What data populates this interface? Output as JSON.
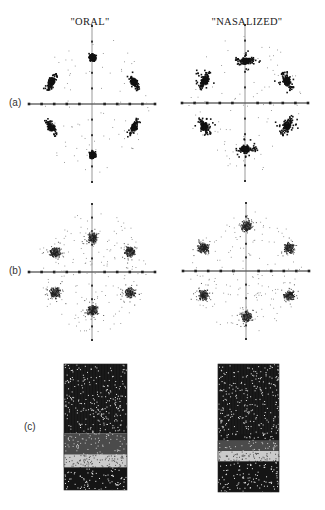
{
  "figure": {
    "columns": [
      {
        "title": "\"ORAL\"",
        "center_x": 90
      },
      {
        "title": "\"NASALIZED\"",
        "center_x": 247
      }
    ],
    "rows": [
      {
        "label": "(a)",
        "type": "polar-scatter"
      },
      {
        "label": "(b)",
        "type": "polar-scatter"
      },
      {
        "label": "(c)",
        "type": "spectrogram"
      }
    ],
    "caption_partial": "(cut off — illegible caption line at bottom edge)"
  },
  "chart_data": [
    {
      "type": "scatter",
      "panel": "(a)",
      "condition": "ORAL",
      "description": "Six-lobed star-shaped cluster pattern on crossed axes with tick marks",
      "axis_ticks_per_half": 5,
      "clusters": [
        {
          "angle_deg": 90,
          "radius": 0.75,
          "density": "dense",
          "shape": "compact"
        },
        {
          "angle_deg": 30,
          "radius": 0.72,
          "density": "dense",
          "shape": "chevron"
        },
        {
          "angle_deg": 150,
          "radius": 0.72,
          "density": "dense",
          "shape": "chevron"
        },
        {
          "angle_deg": 210,
          "radius": 0.72,
          "density": "dense",
          "shape": "chevron"
        },
        {
          "angle_deg": 330,
          "radius": 0.72,
          "density": "dense",
          "shape": "chevron"
        },
        {
          "angle_deg": 270,
          "radius": 0.8,
          "density": "dense",
          "shape": "compact"
        }
      ]
    },
    {
      "type": "scatter",
      "panel": "(a)",
      "condition": "NASALIZED",
      "description": "Six-lobed pattern with spikier, more spread clusters",
      "axis_ticks_per_half": 5,
      "clusters": [
        {
          "angle_deg": 90,
          "radius": 0.68,
          "density": "dense",
          "shape": "spiky"
        },
        {
          "angle_deg": 30,
          "radius": 0.72,
          "density": "dense",
          "shape": "spiky"
        },
        {
          "angle_deg": 150,
          "radius": 0.72,
          "density": "dense",
          "shape": "spiky"
        },
        {
          "angle_deg": 210,
          "radius": 0.72,
          "density": "dense",
          "shape": "spiky"
        },
        {
          "angle_deg": 330,
          "radius": 0.72,
          "density": "dense",
          "shape": "spiky"
        },
        {
          "angle_deg": 270,
          "radius": 0.72,
          "density": "dense",
          "shape": "spiky"
        }
      ]
    },
    {
      "type": "scatter",
      "panel": "(b)",
      "condition": "ORAL",
      "description": "Six-lobed pattern, more diffuse than (a)",
      "axis_ticks_per_half": 5,
      "clusters": [
        {
          "angle_deg": 90,
          "radius": 0.55,
          "density": "medium"
        },
        {
          "angle_deg": 30,
          "radius": 0.65,
          "density": "medium"
        },
        {
          "angle_deg": 150,
          "radius": 0.65,
          "density": "medium"
        },
        {
          "angle_deg": 210,
          "radius": 0.65,
          "density": "medium"
        },
        {
          "angle_deg": 330,
          "radius": 0.65,
          "density": "medium"
        },
        {
          "angle_deg": 270,
          "radius": 0.6,
          "density": "medium"
        }
      ]
    },
    {
      "type": "scatter",
      "panel": "(b)",
      "condition": "NASALIZED",
      "description": "Six triangular clusters with scattered outer points",
      "axis_ticks_per_half": 5,
      "clusters": [
        {
          "angle_deg": 90,
          "radius": 0.72,
          "density": "medium"
        },
        {
          "angle_deg": 30,
          "radius": 0.75,
          "density": "medium"
        },
        {
          "angle_deg": 150,
          "radius": 0.75,
          "density": "medium"
        },
        {
          "angle_deg": 210,
          "radius": 0.75,
          "density": "medium"
        },
        {
          "angle_deg": 330,
          "radius": 0.75,
          "density": "medium"
        },
        {
          "angle_deg": 270,
          "radius": 0.72,
          "density": "medium"
        }
      ]
    },
    {
      "type": "heatmap",
      "panel": "(c)",
      "condition": "ORAL",
      "description": "Spectrogram: dark upper band, light gap band around 70%, dark lower band",
      "bands": [
        {
          "from": 0.0,
          "to": 0.55,
          "intensity": "dark"
        },
        {
          "from": 0.55,
          "to": 0.72,
          "intensity": "mixed"
        },
        {
          "from": 0.72,
          "to": 0.82,
          "intensity": "light"
        },
        {
          "from": 0.82,
          "to": 1.0,
          "intensity": "dark"
        }
      ]
    },
    {
      "type": "heatmap",
      "panel": "(c)",
      "condition": "NASALIZED",
      "description": "Spectrogram: dark upper band with texture, light gap around 68%, dark lower band",
      "bands": [
        {
          "from": 0.0,
          "to": 0.6,
          "intensity": "dark"
        },
        {
          "from": 0.6,
          "to": 0.68,
          "intensity": "mixed"
        },
        {
          "from": 0.68,
          "to": 0.76,
          "intensity": "light"
        },
        {
          "from": 0.76,
          "to": 1.0,
          "intensity": "dark"
        }
      ]
    }
  ]
}
